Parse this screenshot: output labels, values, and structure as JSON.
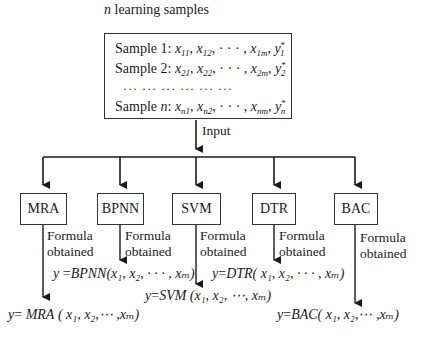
{
  "title": {
    "italic": "n",
    "text": " learning samples"
  },
  "samples": [
    {
      "label": "Sample 1: ",
      "x1": "11",
      "x2": "12",
      "xm": "1m",
      "ysub": "1",
      "ysup": "*"
    },
    {
      "label": "Sample 2: ",
      "x1": "21",
      "x2": "22",
      "xm": "2m",
      "ysub": "2",
      "ysup": "*"
    },
    {
      "label": "Sample ",
      "label_italic": "n",
      "label_suffix": ": ",
      "x1": "n1",
      "x2": "n2",
      "xm": "nm",
      "ysub": "n",
      "ysup": "*"
    }
  ],
  "dots_row": "··· ··· ··· ··· ··· ···",
  "input_label": "Input",
  "models": [
    {
      "name": "MRA",
      "formula_label_1": "Formula",
      "formula_label_2": "obtained",
      "formula_fn": "MRA",
      "formula_args": "( x₁, x₂,⋯ ,xₘ)"
    },
    {
      "name": "BPNN",
      "formula_label_1": "Formula",
      "formula_label_2": "obtained",
      "formula_fn": "BPNN",
      "formula_args": "(x₁, x₂, · · · , xₘ)"
    },
    {
      "name": "SVM",
      "formula_label_1": "Formula",
      "formula_label_2": "obtained",
      "formula_fn": "SVM",
      "formula_args": "(x₁, x₂, ⋯, xₘ)"
    },
    {
      "name": "DTR",
      "formula_label_1": "Formula",
      "formula_label_2": "obtained",
      "formula_fn": "DTR",
      "formula_args": "( x₁, x₂, · · · , xₘ)"
    },
    {
      "name": "BAC",
      "formula_label_1": "Formula",
      "formula_label_2": "obtained",
      "formula_fn": "BAC",
      "formula_args": "( x₁, x₂,⋯ ,xₘ)"
    }
  ],
  "formula_prefix": "y",
  "equals": "=",
  "colors": {
    "line": "#1a1a1a",
    "box_border": "#333333",
    "background": "#ffffff"
  }
}
